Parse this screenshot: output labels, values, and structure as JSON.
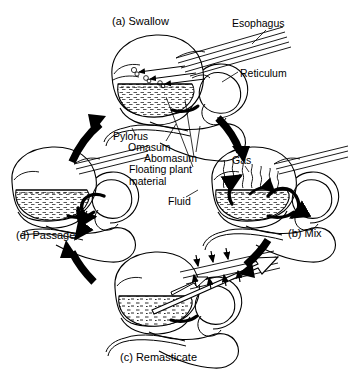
{
  "figure": {
    "background_color": "#ffffff",
    "line_color": "#000000",
    "arrow_color": "#000000"
  },
  "stages": [
    {
      "id": "a",
      "caption": "(a) Swallow",
      "x": 112,
      "y": 16
    },
    {
      "id": "b",
      "caption": "(b) Mix",
      "x": 288,
      "y": 228
    },
    {
      "id": "c",
      "caption": "(c) Remasticate",
      "x": 120,
      "y": 352
    },
    {
      "id": "d",
      "caption": "(d) Passage",
      "x": 16,
      "y": 230
    }
  ],
  "anatomy_labels": [
    {
      "name": "esophagus",
      "text": "Esophagus",
      "x": 232,
      "y": 18
    },
    {
      "name": "reticulum",
      "text": "Reticulum",
      "x": 240,
      "y": 68
    },
    {
      "name": "pylorus",
      "text": "Pylorus",
      "x": 113,
      "y": 131
    },
    {
      "name": "omasum",
      "text": "Omasum",
      "x": 128,
      "y": 142
    },
    {
      "name": "abomasum",
      "text": "Abomasum",
      "x": 144,
      "y": 153
    },
    {
      "name": "floating-plant-material",
      "text": "Floating plant",
      "x": 129,
      "y": 164
    },
    {
      "name": "floating-plant-material-2",
      "text": "material",
      "x": 129,
      "y": 176
    },
    {
      "name": "gas",
      "text": "Gas",
      "x": 232,
      "y": 155
    },
    {
      "name": "fluid",
      "text": "Fluid",
      "x": 168,
      "y": 196
    }
  ],
  "cycle_arrows": [
    {
      "name": "arrow-d-to-a",
      "from": "d",
      "to": "a",
      "direction": "up-right"
    },
    {
      "name": "arrow-a-to-b",
      "from": "a",
      "to": "b",
      "direction": "down-right"
    },
    {
      "name": "arrow-b-to-c",
      "from": "b",
      "to": "c",
      "direction": "down-left"
    },
    {
      "name": "arrow-c-to-d",
      "from": "c",
      "to": "d",
      "direction": "up-left"
    }
  ]
}
